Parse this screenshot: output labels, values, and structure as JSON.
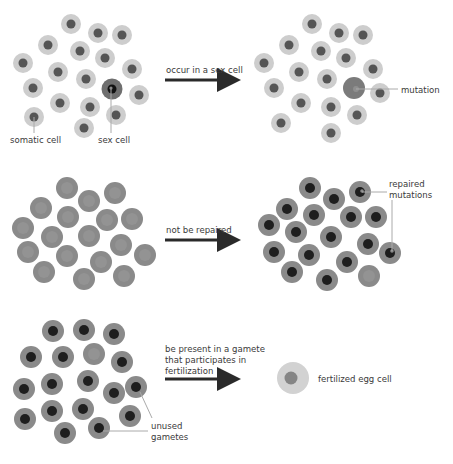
{
  "colors": {
    "light_cell": "#cdcdcd",
    "light_nucleus": "#555555",
    "dark_cell": "#8a8a8a",
    "dark_nucleus": "#1e1e1e",
    "mutation_cell": "#7b7b7b",
    "arrow": "#2a2a2a",
    "leader_line": "#aaaaaa"
  },
  "stages": [
    {
      "name": "mutation-in-sex-cell",
      "arrow_label": "occur in a sex cell",
      "labels": {
        "somatic": "somatic cell",
        "sex": "sex cell",
        "mutation": "mutation"
      }
    },
    {
      "name": "not-repaired",
      "arrow_label": "not be repaired",
      "labels": {
        "repaired_line1": "repaired",
        "repaired_line2": "mutations"
      }
    },
    {
      "name": "fertilization",
      "arrow_label_line1": "be present in a gamete",
      "arrow_label_line2": "that participates in",
      "arrow_label_line3": "fertilization",
      "labels": {
        "unused_line1": "unused",
        "unused_line2": "gametes",
        "egg": "fertilized egg cell"
      }
    }
  ]
}
